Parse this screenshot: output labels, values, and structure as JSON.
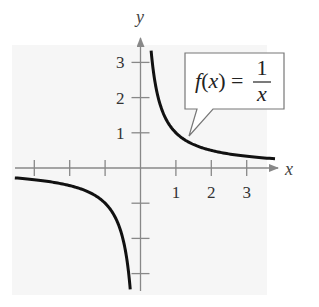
{
  "chart_data": {
    "type": "line",
    "title": "",
    "function_label": {
      "lhs": "f(x) =",
      "numerator": "1",
      "denominator": "x"
    },
    "xlabel": "x",
    "ylabel": "y",
    "xlim": [
      -3.55,
      3.8
    ],
    "ylim": [
      -3.45,
      3.6
    ],
    "x_ticks": [
      -3,
      -2,
      -1,
      1,
      2,
      3
    ],
    "x_tick_labels": [
      "",
      "",
      "",
      "1",
      "2",
      "3"
    ],
    "y_ticks": [
      -3,
      -2,
      -1,
      1,
      2,
      3
    ],
    "y_tick_labels": [
      "",
      "",
      "",
      "1",
      "2",
      "3"
    ],
    "grid": false,
    "series": [
      {
        "name": "f(x) = 1/x (x > 0)",
        "x": [
          0.3,
          0.35,
          0.4,
          0.5,
          0.6,
          0.75,
          1,
          1.25,
          1.5,
          2,
          2.5,
          3,
          3.5,
          3.8
        ],
        "y": [
          3.33,
          2.86,
          2.5,
          2,
          1.67,
          1.33,
          1,
          0.8,
          0.67,
          0.5,
          0.4,
          0.33,
          0.29,
          0.26
        ]
      },
      {
        "name": "f(x) = 1/x (x < 0)",
        "x": [
          -3.55,
          -3,
          -2.5,
          -2,
          -1.5,
          -1.25,
          -1,
          -0.75,
          -0.6,
          -0.5,
          -0.4,
          -0.35,
          -0.29
        ],
        "y": [
          -0.28,
          -0.33,
          -0.4,
          -0.5,
          -0.67,
          -0.8,
          -1,
          -1.33,
          -1.67,
          -2,
          -2.5,
          -2.86,
          -3.45
        ]
      }
    ],
    "annotations": [
      {
        "text": "f(x) = 1/x",
        "type": "callout",
        "points_to": [
          1.35,
          0.74
        ]
      }
    ],
    "colors": {
      "curve": "#111111",
      "axes": "#888888",
      "background_panel": "#f6f6f6"
    }
  }
}
